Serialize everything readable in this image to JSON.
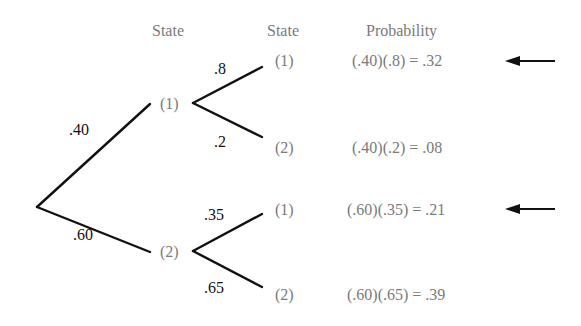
{
  "headers": {
    "stage1_state": "State",
    "stage2_state": "State",
    "probability": "Probability"
  },
  "root_branches": [
    {
      "label": ".40",
      "state": "(1)"
    },
    {
      "label": ".60",
      "state": "(2)"
    }
  ],
  "outcomes": [
    {
      "branch_label": ".8",
      "state": "(1)",
      "probability": "(.40)(.8) = .32",
      "highlighted": true
    },
    {
      "branch_label": ".2",
      "state": "(2)",
      "probability": "(.40)(.2) = .08",
      "highlighted": false
    },
    {
      "branch_label": ".35",
      "state": "(1)",
      "probability": "(.60)(.35) = .21",
      "highlighted": true
    },
    {
      "branch_label": ".65",
      "state": "(2)",
      "probability": "(.60)(.65) = .39",
      "highlighted": false
    }
  ],
  "icons": {
    "arrow": "left-arrow"
  },
  "colors": {
    "lines": "#111111",
    "state_text": "#7a7a7a",
    "branch_text": "#111111",
    "background": "#ffffff"
  }
}
